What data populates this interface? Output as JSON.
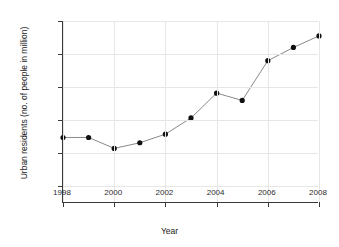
{
  "chart_data": {
    "type": "line",
    "title": "",
    "xlabel": "Year",
    "ylabel": "Urban residents (no. of people in million)",
    "x": [
      1998,
      1999,
      2000,
      2001,
      2002,
      2003,
      2004,
      2005,
      2006,
      2007,
      2008
    ],
    "values": [
      164.8,
      164.8,
      161.5,
      163.2,
      165.8,
      170.7,
      178.2,
      176.0,
      188.0,
      192.0,
      195.5
    ],
    "xlim": [
      1998,
      2008
    ],
    "ylim": [
      145.0,
      200.0
    ],
    "xticks": [
      1998,
      2000,
      2002,
      2004,
      2006,
      2008
    ],
    "xticklabels": [
      "1998",
      "2000",
      "2002",
      "2004",
      "2006",
      "2008"
    ],
    "yticks": [
      150.0,
      160.0,
      170.0,
      180.0,
      190.0,
      200.0
    ],
    "yticklabels": [
      "150.0",
      "160.0",
      "170.0",
      "180.0",
      "190.0",
      "200.0"
    ],
    "grid": true,
    "legend": null,
    "marker": "circle",
    "marker_color": "#101010",
    "line_color": "#6b6b6b",
    "grid_color": "#e6e6e6",
    "axis_color": "#3a3a3a",
    "background_color": "#ffffff"
  }
}
